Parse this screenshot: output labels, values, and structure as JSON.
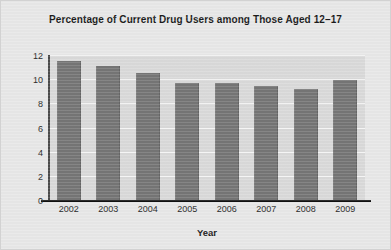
{
  "figure": {
    "title": "Percentage of Current Drug Users among Those Aged 12–17",
    "background_color": "#e7e7e7",
    "plot_background_color": "#d9d9d9",
    "bar_color": "#757575",
    "gridline_color": "#f4f4f4",
    "axis_color": "#111111"
  },
  "chart_data": {
    "type": "bar",
    "title": "Percentage of Current Drug Users among Those Aged 12–17",
    "xlabel": "Year",
    "ylabel": "",
    "categories": [
      "2002",
      "2003",
      "2004",
      "2005",
      "2006",
      "2007",
      "2008",
      "2009"
    ],
    "values": [
      11.6,
      11.2,
      10.6,
      9.8,
      9.8,
      9.5,
      9.3,
      10.0
    ],
    "ylim": [
      0,
      12
    ],
    "yticks": [
      0,
      2,
      4,
      6,
      8,
      10,
      12
    ],
    "ytick_labels": [
      "0",
      "2",
      "4",
      "6",
      "8",
      "10",
      "12"
    ],
    "grid": true,
    "grid_axis": "y",
    "legend": false,
    "legend_position": "none",
    "series": [
      {
        "name": "Percentage of current drug users",
        "values": [
          11.6,
          11.2,
          10.6,
          9.8,
          9.8,
          9.5,
          9.3,
          10.0
        ]
      }
    ]
  }
}
